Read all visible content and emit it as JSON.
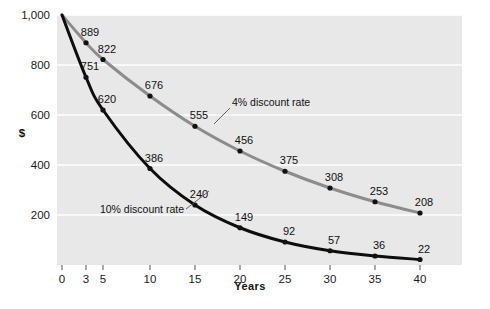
{
  "chart_data": {
    "type": "line",
    "title": "",
    "xlabel": "Years",
    "ylabel": "$",
    "x": [
      0,
      3,
      5,
      10,
      15,
      20,
      25,
      30,
      35,
      40
    ],
    "xtick_labels": [
      "0",
      "3",
      "5",
      "10",
      "15",
      "20",
      "25",
      "30",
      "35",
      "40"
    ],
    "ytick_labels": [
      "200",
      "400",
      "600",
      "800",
      "1,000"
    ],
    "ytick_values": [
      200,
      400,
      600,
      800,
      1000
    ],
    "ylim": [
      0,
      1000
    ],
    "xlim": [
      0,
      40
    ],
    "grid": "horizontal",
    "legend_position": "inline-annotation",
    "series": [
      {
        "name": "4% discount rate",
        "color": "#8c8c8c",
        "values": [
          1000,
          889,
          822,
          676,
          555,
          456,
          375,
          308,
          253,
          208
        ],
        "point_labels": [
          "",
          "889",
          "822",
          "676",
          "555",
          "456",
          "375",
          "308",
          "253",
          "208"
        ]
      },
      {
        "name": "10% discount rate",
        "color": "#0d0d0d",
        "values": [
          1000,
          751,
          620,
          386,
          240,
          149,
          92,
          57,
          36,
          22
        ],
        "point_labels": [
          "",
          "751",
          "620",
          "386",
          "240",
          "149",
          "92",
          "57",
          "36",
          "22"
        ]
      }
    ],
    "annotations": [
      {
        "text": "4% discount rate",
        "series": "4% discount rate"
      },
      {
        "text": "10% discount rate",
        "series": "10% discount rate"
      }
    ],
    "colors": {
      "panel_background": "#e8e8e8",
      "gridline": "#ffffff",
      "page_background": "#ffffff",
      "text": "#111111"
    }
  }
}
